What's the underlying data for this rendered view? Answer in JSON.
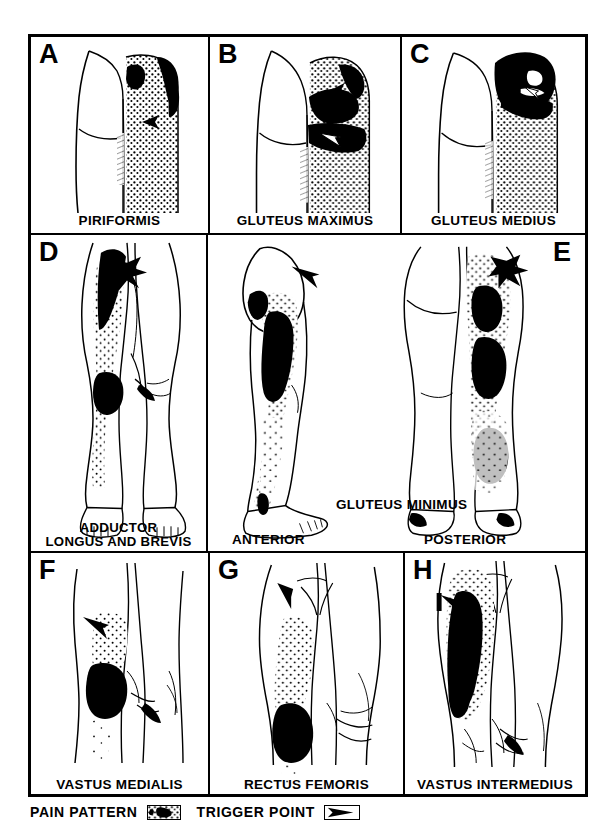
{
  "figure": {
    "type": "medical-illustration-grid",
    "rows": 3
  },
  "panels": [
    {
      "letter": "A",
      "label": "PIRIFORMIS",
      "view": "posterior-buttock-and-thigh",
      "pain_pattern": "stippled over right buttock and posterior thigh with solid black over lateral buttock",
      "trigger_points": 1
    },
    {
      "letter": "B",
      "label": "GLUTEUS MAXIMUS",
      "view": "posterior-buttock-and-thigh",
      "pain_pattern": "stippled over right buttock with solid black band across gluteal fold",
      "trigger_points": 3
    },
    {
      "letter": "C",
      "label": "GLUTEUS MEDIUS",
      "view": "posterior-buttock-and-thigh",
      "pain_pattern": "solid black over upper buttock and iliac crest with stipple down posterior thigh",
      "trigger_points": 2
    },
    {
      "letter": "D",
      "label_lines": [
        "ADDUCTOR",
        "LONGUS AND BREVIS"
      ],
      "view": "anterior-full-leg",
      "pain_pattern": "solid black over groin and medial knee with stipple down medial lower leg",
      "trigger_points": 1
    },
    {
      "letter": "E",
      "label": "GLUTEUS MINIMUS",
      "view": "anterior-and-posterior-full-leg",
      "sub_labels": [
        "ANTERIOR",
        "POSTERIOR"
      ],
      "pain_pattern": "solid black over lateral thigh and calf with surrounding stipple",
      "trigger_points": 2
    },
    {
      "letter": "F",
      "label": "VASTUS MEDIALIS",
      "view": "anterior-knee",
      "pain_pattern": "solid black over medial knee with stipple above",
      "trigger_points": 1
    },
    {
      "letter": "G",
      "label": "RECTUS FEMORIS",
      "view": "anterior-thigh-and-knee",
      "pain_pattern": "stipple down anterior thigh into solid black over knee",
      "trigger_points": 1
    },
    {
      "letter": "H",
      "label": "VASTUS INTERMEDIUS",
      "view": "anterior-thigh",
      "pain_pattern": "solid black over mid anterior thigh with surrounding stipple",
      "trigger_points": 1
    }
  ],
  "center_panel": {
    "title": "GLUTEUS MINIMUS",
    "letter": "E",
    "anterior_label": "ANTERIOR",
    "posterior_label": "POSTERIOR"
  },
  "legend": {
    "pain_pattern_label": "PAIN PATTERN",
    "trigger_point_label": "TRIGGER POINT",
    "pain_pattern_swatch": "stipple-and-solid-swatch",
    "trigger_point_swatch": "arrowhead-in-box"
  },
  "colors": {
    "ink": "#000000",
    "paper": "#ffffff"
  }
}
